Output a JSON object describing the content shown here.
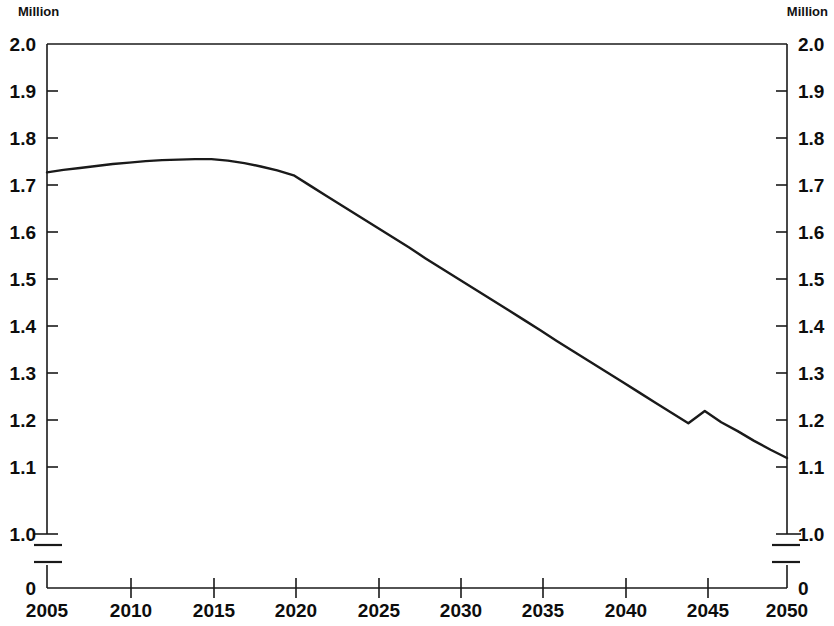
{
  "axes": {
    "unit_label_left": "Million",
    "unit_label_right": "Million",
    "y_tick_labels": [
      "2.0",
      "1.9",
      "1.8",
      "1.7",
      "1.6",
      "1.5",
      "1.4",
      "1.3",
      "1.2",
      "1.1",
      "1.0",
      "0"
    ],
    "x_tick_labels": [
      "2005",
      "2010",
      "2015",
      "2020",
      "2025",
      "2030",
      "2035",
      "2040",
      "2045",
      "2050"
    ],
    "axis_break": true,
    "line_color": "#1a1a1a"
  },
  "chart_data": {
    "type": "line",
    "title": "",
    "subtitle": "",
    "xlabel": "",
    "ylabel": "Million",
    "ylabel_right": "Million",
    "xlim": [
      2005,
      2050
    ],
    "ylim": [
      1.0,
      2.0
    ],
    "y_axis_has_break_to_zero": true,
    "y_ticks": [
      1.0,
      1.1,
      1.2,
      1.3,
      1.4,
      1.5,
      1.6,
      1.7,
      1.8,
      1.9,
      2.0
    ],
    "x_ticks": [
      2005,
      2010,
      2015,
      2020,
      2025,
      2030,
      2035,
      2040,
      2045,
      2050
    ],
    "grid": false,
    "legend": null,
    "series": [
      {
        "name": "Population",
        "x": [
          2005,
          2006,
          2007,
          2008,
          2009,
          2010,
          2011,
          2012,
          2013,
          2014,
          2015,
          2016,
          2017,
          2018,
          2019,
          2020,
          2021,
          2022,
          2023,
          2024,
          2025,
          2026,
          2027,
          2028,
          2029,
          2030,
          2031,
          2032,
          2033,
          2034,
          2035,
          2036,
          2037,
          2038,
          2039,
          2040,
          2041,
          2042,
          2043,
          2044,
          2045,
          2046,
          2047,
          2048,
          2049,
          2050
        ],
        "values": [
          1.738,
          1.743,
          1.747,
          1.751,
          1.755,
          1.758,
          1.761,
          1.763,
          1.764,
          1.765,
          1.765,
          1.762,
          1.757,
          1.75,
          1.742,
          1.732,
          1.711,
          1.69,
          1.669,
          1.648,
          1.627,
          1.606,
          1.585,
          1.563,
          1.542,
          1.521,
          1.5,
          1.479,
          1.458,
          1.437,
          1.416,
          1.394,
          1.373,
          1.352,
          1.331,
          1.31,
          1.289,
          1.268,
          1.247,
          1.226,
          1.251,
          1.228,
          1.21,
          1.19,
          1.172,
          1.155
        ]
      }
    ]
  }
}
